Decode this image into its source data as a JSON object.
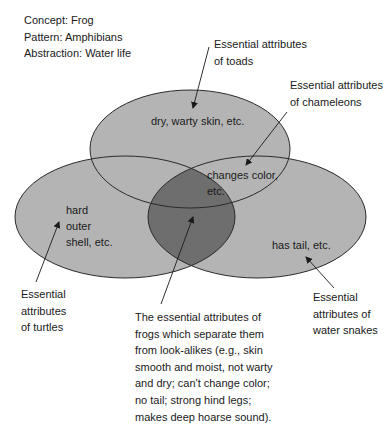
{
  "header": {
    "concept": "Concept:  Frog",
    "pattern": "Pattern:  Amphibians",
    "abstraction": "Abstraction:  Water life"
  },
  "colors": {
    "circle_fill": "#b4b4b4",
    "overlap_fill": "#6e6e6e",
    "stroke": "#2a2a2a",
    "text": "#1a1a1a"
  },
  "circles": {
    "toads": {
      "inner_text": "dry, warty skin, etc.",
      "label_lines": [
        "Essential attributes",
        "of toads"
      ]
    },
    "chameleons": {
      "inner_lines": [
        "changes color,",
        "etc."
      ],
      "label_lines": [
        "Essential attributes",
        "of chameleons"
      ]
    },
    "turtles": {
      "inner_lines": [
        "hard",
        "outer",
        "shell, etc."
      ],
      "label_lines": [
        "Essential",
        "attributes",
        "of turtles"
      ]
    },
    "water_snakes": {
      "inner_text": "has tail, etc.",
      "label_lines": [
        "Essential",
        "attributes of",
        "water snakes"
      ]
    }
  },
  "frog_description": {
    "lines": [
      "The essential attributes of",
      "frogs which separate them",
      "from look-alikes (e.g., skin",
      "smooth and moist, not warty",
      "and dry; can't change color;",
      "no tail; strong hind legs;",
      "makes deep hoarse sound)."
    ]
  }
}
